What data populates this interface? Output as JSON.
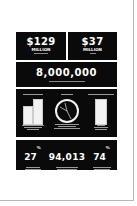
{
  "infographic": {
    "stat1": {
      "value": "$129",
      "unit": "MILLION",
      "caption": "[illegible caption]"
    },
    "stat2": {
      "value": "$37",
      "unit": "MILLION",
      "caption": "[illegible caption]"
    },
    "stat3": {
      "value": "8,000,000",
      "caption": "[illegible caption]"
    },
    "panels": [
      {
        "heading": "[illegible heading]",
        "caption": "[illegible caption]",
        "graphic": "bar-comparison"
      },
      {
        "heading": "[illegible heading]",
        "caption": "[illegible caption]",
        "graphic": "pie-circle"
      },
      {
        "heading": "[illegible heading]",
        "caption": "[illegible caption]",
        "graphic": "single-bar"
      }
    ],
    "bottom": [
      {
        "value": "27",
        "suffix": "%",
        "caption": "[illegible caption]"
      },
      {
        "value": "94,013",
        "suffix": "",
        "caption": "[illegible caption]"
      },
      {
        "value": "74",
        "suffix": "%",
        "caption": "[illegible caption]"
      }
    ]
  },
  "colors": {
    "panel": "#0a0a0a",
    "text": "#ffffff",
    "page": "#ffffff",
    "border": "#b8b8b8"
  }
}
